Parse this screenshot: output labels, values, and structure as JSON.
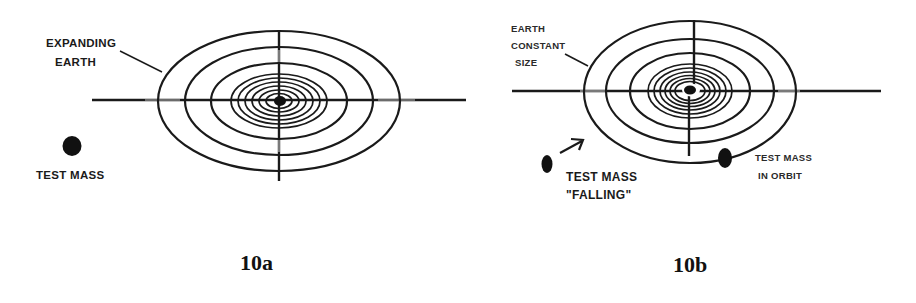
{
  "figures": [
    {
      "id": "10a",
      "caption": "10a",
      "labels": {
        "earth_line1": "EXPANDING",
        "earth_line2": "EARTH",
        "test_mass": "TEST MASS"
      },
      "description": "Concentric ellipses (expanding Earth) with crosshair axes; a stationary test mass to the left"
    },
    {
      "id": "10b",
      "caption": "10b",
      "labels": {
        "earth_line1": "EARTH",
        "earth_line2": "CONSTANT",
        "earth_line3": "SIZE",
        "falling_line1": "TEST MASS",
        "falling_line2": "\"FALLING\"",
        "orbit_line1": "TEST MASS",
        "orbit_line2": "IN ORBIT"
      },
      "description": "Concentric ellipses (Earth of constant size) with crosshair axes; a falling test mass with arrow and a test mass in orbit on the outer ellipse"
    }
  ],
  "colors": {
    "ink": "#1a1a1a",
    "background": "#ffffff"
  }
}
